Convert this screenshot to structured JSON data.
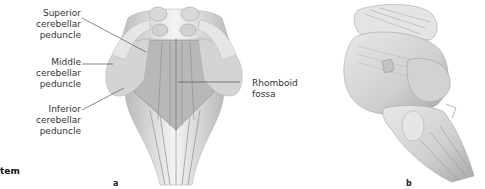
{
  "figure": {
    "caption_fragment": "tem",
    "panels": [
      {
        "id": "a",
        "letter": "a",
        "labels": [
          {
            "text": "Superior\ncerebellar\npeduncle"
          },
          {
            "text": "Middle\ncerebellar\npeduncle"
          },
          {
            "text": "Inferior\ncerebellar\npeduncle"
          },
          {
            "text": "Rhomboid\nfossa"
          }
        ]
      },
      {
        "id": "b",
        "letter": "b",
        "labels": []
      }
    ],
    "colors": {
      "peduncle_cut": "#d4d4d4",
      "tissue_light": "#f0f0f0",
      "tissue_mid": "#c8c8c8",
      "tissue_dark": "#9a9a9a",
      "leader_line": "#555555",
      "label_text": "#333333"
    }
  }
}
